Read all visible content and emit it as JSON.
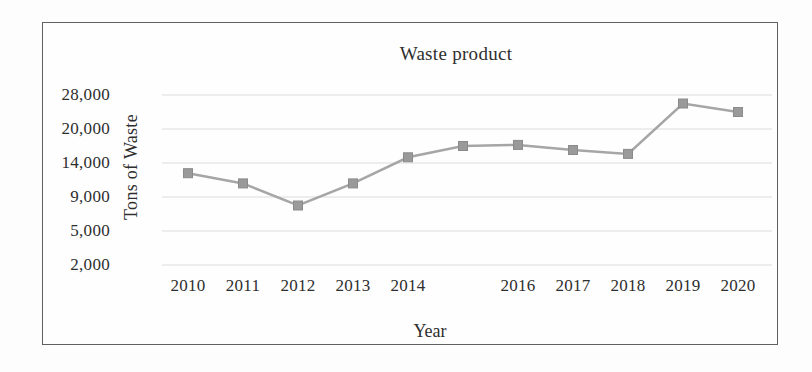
{
  "chart_data": {
    "type": "line",
    "title": "Waste product",
    "xlabel": "Year",
    "ylabel": "Tons of Waste",
    "x": [
      2010,
      2011,
      2012,
      2013,
      2014,
      2015,
      2016,
      2017,
      2018,
      2019,
      2020
    ],
    "x_tick_labels": [
      "2010",
      "2011",
      "2012",
      "2013",
      "2014",
      "",
      "2016",
      "2017",
      "2018",
      "2019",
      "2020"
    ],
    "y_tick_labels": [
      "28,000",
      "20,000",
      "14,000",
      "9,000",
      "5,000",
      "2,000"
    ],
    "y_tick_values": [
      28000,
      20000,
      14000,
      9000,
      5000,
      2000
    ],
    "series": [
      {
        "name": "Waste product",
        "values": [
          12500,
          11000,
          8000,
          11000,
          15000,
          17000,
          17200,
          16300,
          15600,
          26000,
          24000
        ]
      }
    ],
    "axis_note": "y axis is non-linear: unequal tick values 2000,5000,9000,14000,20000,28000 are evenly spaced; 2015 x label is absent though its data point is plotted",
    "grid": true,
    "legend": false,
    "marker": "square",
    "colors": {
      "line": "#a6a6a6",
      "marker": "#9a9a9a",
      "marker_edge": "#8b8b8b",
      "grid": "#dcdcdc",
      "frame": "#606060",
      "text": "#2e2e2e",
      "background": "#fdfdfd"
    }
  }
}
